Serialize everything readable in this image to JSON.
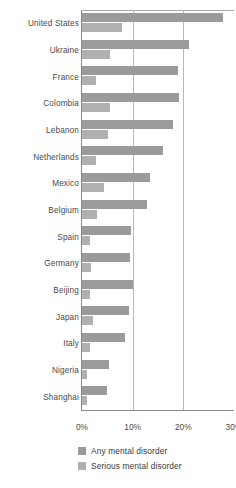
{
  "chart_data": {
    "type": "bar",
    "orientation": "horizontal",
    "title": "",
    "xlabel": "",
    "ylabel": "",
    "xlim": [
      0,
      30
    ],
    "xticks": [
      "0%",
      "10%",
      "20%",
      "30%"
    ],
    "xtick_values": [
      0,
      10,
      20,
      30
    ],
    "grid": "vertical gridlines at 10% and 20%",
    "legend_position": "bottom",
    "categories": [
      "United States",
      "Ukraine",
      "France",
      "Colombia",
      "Lebanon",
      "Netherlands",
      "Mexico",
      "Belgium",
      "Spain",
      "Germany",
      "Beijing",
      "Japan",
      "Italy",
      "Nigeria",
      "Shanghai"
    ],
    "series": [
      {
        "name": "Any mental disorder",
        "color": "#9b9b9b",
        "values": [
          27.8,
          21.2,
          19.0,
          19.2,
          17.9,
          16.0,
          13.4,
          12.9,
          9.6,
          9.5,
          10.0,
          9.2,
          8.4,
          5.4,
          5.0
        ]
      },
      {
        "name": "Serious mental disorder",
        "color": "#b0b0b0",
        "values": [
          7.8,
          5.6,
          2.7,
          5.6,
          5.1,
          2.8,
          4.3,
          3.0,
          1.6,
          1.7,
          1.6,
          2.2,
          1.6,
          0.9,
          0.9
        ]
      }
    ]
  },
  "legend": {
    "items": [
      {
        "label": "Any mental disorder",
        "color": "#9b9b9b",
        "swatch_name": "legend-swatch-any"
      },
      {
        "label": "Serious mental disorder",
        "color": "#b0b0b0",
        "swatch_name": "legend-swatch-serious"
      }
    ]
  },
  "colors": {
    "background": "#ffffff",
    "axis": "#8a8a8a",
    "gridline": "#b8b8b8",
    "text": "#3b3b3b",
    "series_any": "#9b9b9b",
    "series_serious": "#b0b0b0"
  }
}
